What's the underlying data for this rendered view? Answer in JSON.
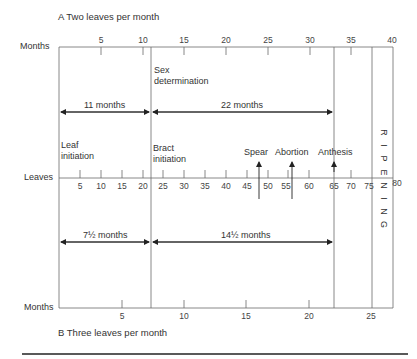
{
  "diagram": {
    "title_top": "A  Two leaves per month",
    "title_bottom": "B  Three leaves per month",
    "axes": {
      "top": {
        "label": "Months",
        "ticks": [
          "5",
          "10",
          "15",
          "20",
          "25",
          "30",
          "35",
          "40"
        ]
      },
      "middle": {
        "label": "Leaves",
        "ticks": [
          "5",
          "10",
          "15",
          "20",
          "25",
          "30",
          "35",
          "40",
          "45",
          "50",
          "55",
          "60",
          "65",
          "70",
          "75",
          "80"
        ]
      },
      "bottom": {
        "label": "Months",
        "ticks": [
          "5",
          "10",
          "15",
          "20",
          "25"
        ]
      }
    },
    "annotations": {
      "sex_determination": "Sex\ndetermination",
      "sex_line1": "Sex",
      "sex_line2": "determination",
      "leaf_initiation_1": "Leaf",
      "leaf_initiation_2": "initiation",
      "bract_initiation_1": "Bract",
      "bract_initiation_2": "initiation",
      "spear": "Spear",
      "abortion": "Abortion",
      "anthesis": "Anthesis",
      "ripening": [
        "R",
        "I",
        "P",
        "E",
        "N",
        "I",
        "N",
        "G"
      ]
    },
    "intervals": {
      "a_first": "11 months",
      "a_second": "22 months",
      "b_first": "7½ months",
      "b_second": "14½ months"
    },
    "colors": {
      "line": "#555555",
      "text": "#333333",
      "rule": "#222222"
    }
  }
}
